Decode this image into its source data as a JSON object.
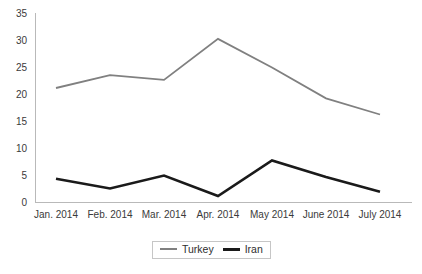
{
  "chart_data": {
    "type": "line",
    "title": "",
    "xlabel": "",
    "ylabel": "",
    "categories": [
      "Jan. 2014",
      "Feb. 2014",
      "Mar. 2014",
      "Apr. 2014",
      "May 2014",
      "June 2014",
      "July 2014"
    ],
    "series": [
      {
        "name": "Turkey",
        "color": "#808080",
        "values": [
          21.2,
          23.6,
          22.7,
          30.3,
          25.0,
          19.3,
          16.3
        ]
      },
      {
        "name": "Iran",
        "color": "#1a1a1a",
        "values": [
          4.4,
          2.6,
          5.0,
          1.2,
          7.8,
          4.7,
          2.0
        ]
      }
    ],
    "ylim": [
      0,
      35
    ],
    "y_ticks": [
      "0",
      "5",
      "10",
      "15",
      "20",
      "25",
      "30",
      "35"
    ],
    "grid": false,
    "legend_position": "bottom-center"
  },
  "legend": {
    "entries": [
      {
        "label": "Turkey",
        "swatch": "turkey-line-swatch"
      },
      {
        "label": "Iran",
        "swatch": "iran-line-swatch"
      }
    ]
  },
  "axes": {
    "y_axis_name": "y-axis",
    "x_axis_name": "x-axis"
  }
}
